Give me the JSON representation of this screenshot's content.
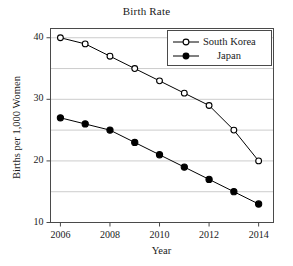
{
  "chart_data": {
    "type": "line",
    "title": "Birth Rate",
    "xlabel": "Year",
    "ylabel": "Births per 1,000 Women",
    "x": [
      2006,
      2007,
      2008,
      2009,
      2010,
      2011,
      2012,
      2013,
      2014
    ],
    "xlim": [
      2005.6,
      2014.6
    ],
    "ylim": [
      10,
      41.5
    ],
    "xticks": [
      2006,
      2008,
      2010,
      2012,
      2014
    ],
    "xtick_labels": [
      "2006",
      "2008",
      "2010",
      "2012",
      "2014"
    ],
    "yticks": [
      10,
      20,
      30,
      40
    ],
    "ytick_labels": [
      "10",
      "20",
      "30",
      "40"
    ],
    "gridlines_y": [
      10,
      15,
      20,
      25,
      30,
      35,
      40
    ],
    "grid": true,
    "grid_axis": "y",
    "grid_color": "#bfbfbf",
    "legend_position": "top-right",
    "series": [
      {
        "name": "South Korea",
        "marker": "open-circle",
        "color": "#000000",
        "values": [
          40,
          39,
          37,
          35,
          33,
          31,
          29,
          25,
          20
        ]
      },
      {
        "name": "Japan",
        "marker": "filled-circle",
        "color": "#000000",
        "values": [
          27,
          26,
          25,
          23,
          21,
          19,
          17,
          15,
          13
        ]
      }
    ]
  },
  "legend": {
    "entries": [
      {
        "label": "South Korea"
      },
      {
        "label": "Japan"
      }
    ]
  }
}
